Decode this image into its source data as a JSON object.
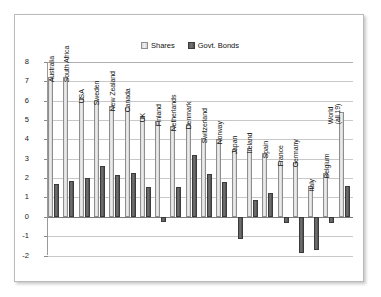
{
  "chart_data": {
    "type": "bar",
    "title": "",
    "xlabel": "",
    "ylabel": "",
    "ylim": [
      -2,
      8
    ],
    "yticks": [
      8,
      7,
      6,
      5,
      4,
      3,
      2,
      1,
      0,
      -1,
      -2
    ],
    "grid": true,
    "legend_position": "top-center",
    "categories": [
      "Australia",
      "South Africa",
      "USA",
      "Sweden",
      "New Zealand",
      "Canada",
      "UK",
      "Finland",
      "Netherlands",
      "Denmark",
      "Switzerland",
      "Norway",
      "Japan",
      "Ireland",
      "Spain",
      "France",
      "Germany",
      "Italy",
      "Belgium",
      "World (all 19)"
    ],
    "series": [
      {
        "name": "Shares",
        "color": "#dcdcdc",
        "values": [
          7.2,
          7.2,
          6.15,
          6.05,
          5.75,
          5.7,
          5.15,
          4.95,
          4.7,
          4.8,
          4.05,
          4.0,
          3.5,
          3.55,
          3.3,
          2.9,
          2.85,
          1.6,
          2.25,
          5.4
        ]
      },
      {
        "name": "Govt. Bonds",
        "color": "#5f5f5f",
        "values": [
          1.7,
          1.85,
          2.0,
          2.6,
          2.15,
          2.25,
          1.55,
          -0.25,
          1.55,
          3.2,
          2.2,
          1.8,
          -1.15,
          0.85,
          1.25,
          -0.3,
          -1.85,
          -1.7,
          -0.3,
          1.6
        ]
      }
    ]
  },
  "legend": {
    "items": [
      {
        "label": "Shares"
      },
      {
        "label": "Govt. Bonds"
      }
    ]
  },
  "colors": {
    "shares": "#dcdcdc",
    "bonds": "#5f5f5f",
    "grid": "#c8c8c8",
    "zero_axis": "#7a7a7a",
    "frame_border": "#b9b9b9",
    "background": "#ffffff"
  }
}
